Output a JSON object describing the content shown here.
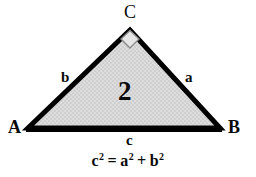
{
  "figure": {
    "background_color": "#ffffff",
    "width": 256,
    "height": 177
  },
  "triangle": {
    "fill_color": "#d9d9d9",
    "stroke_color": "#000000",
    "stroke_width": 5,
    "vertices": {
      "A": {
        "x": 28,
        "y": 128
      },
      "B": {
        "x": 220,
        "y": 128
      },
      "C": {
        "x": 130,
        "y": 30
      }
    },
    "region_label": "2"
  },
  "right_angle_marker": {
    "name": "right-angle-marker",
    "shape": "diamond",
    "stroke_color": "#8a8a8a",
    "fill_color": "#e3e3e3",
    "at_vertex": "C"
  },
  "vertex_labels": [
    {
      "id": "A",
      "text": "A",
      "x": 8,
      "y": 119
    },
    {
      "id": "B",
      "text": "B",
      "x": 228,
      "y": 119
    },
    {
      "id": "C",
      "text": "C",
      "x": 124,
      "y": 4
    }
  ],
  "side_labels": [
    {
      "id": "b",
      "text": "b",
      "x": 61,
      "y": 71
    },
    {
      "id": "a",
      "text": "a",
      "x": 185,
      "y": 71
    },
    {
      "id": "c",
      "text": "c",
      "x": 126,
      "y": 132
    }
  ],
  "formula": {
    "base_c": "c",
    "sup_c": "2",
    "equals": "=",
    "base_a": "a",
    "sup_a": "2",
    "plus": "+",
    "base_b": "b",
    "sup_b": "2",
    "plain_text": "c² = a² + b²"
  }
}
